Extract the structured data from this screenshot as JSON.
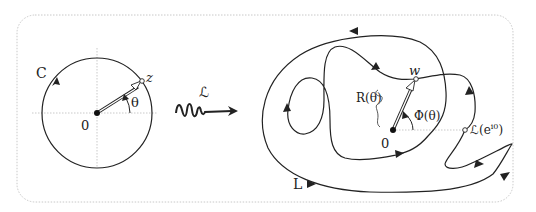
{
  "figure": {
    "frame": {
      "style": "dotted-rounded-rectangle",
      "color": "#c8c8c8"
    },
    "left_panel": {
      "curve_label": "C",
      "point_label": "z",
      "origin_label": "0",
      "angle_label": "θ",
      "description": "unit circle C traversed counter-clockwise with radius vector to point z at angle θ"
    },
    "transform": {
      "label": "ℒ",
      "description": "wavy arrow mapping left panel to right panel"
    },
    "right_panel": {
      "curve_label": "L",
      "point_label": "w",
      "origin_label": "0",
      "radius_label": "R(θ)",
      "angle_label": "Φ(θ)",
      "image_point_label": "ℒ(e",
      "image_point_exponent": "i0",
      "image_point_close": ")",
      "description": "winding closed curve L, image of C under ℒ, with polar radius R(θ) and angle Φ(θ) to point w"
    },
    "colors": {
      "stroke": "#222222",
      "axis": "#bbbbbb",
      "vector_fill": "#ffffff"
    }
  }
}
